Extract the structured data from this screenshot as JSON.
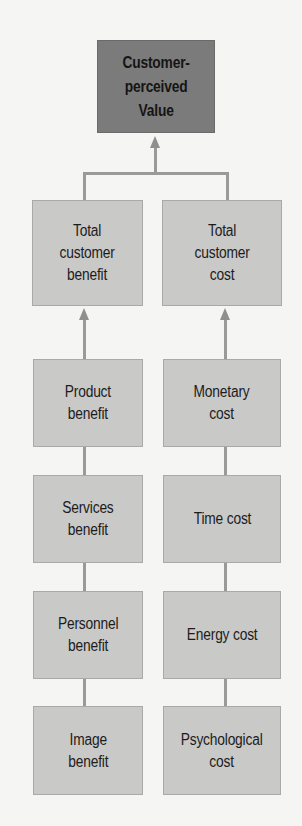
{
  "diagram": {
    "top": {
      "label": "Customer-\nperceived\nValue"
    },
    "left_column": {
      "total": "Total\ncustomer\nbenefit",
      "items": [
        "Product\nbenefit",
        "Services\nbenefit",
        "Personnel\nbenefit",
        "Image\nbenefit"
      ]
    },
    "right_column": {
      "total": "Total\ncustomer\ncost",
      "items": [
        "Monetary\ncost",
        "Time cost",
        "Energy cost",
        "Psychological\ncost"
      ]
    },
    "colors": {
      "background": "#f5f5f4",
      "top_box": "#7b7b7b",
      "box": "#c9c9c8",
      "connector": "#9a9a9a",
      "text": "#1c1c1c"
    }
  }
}
